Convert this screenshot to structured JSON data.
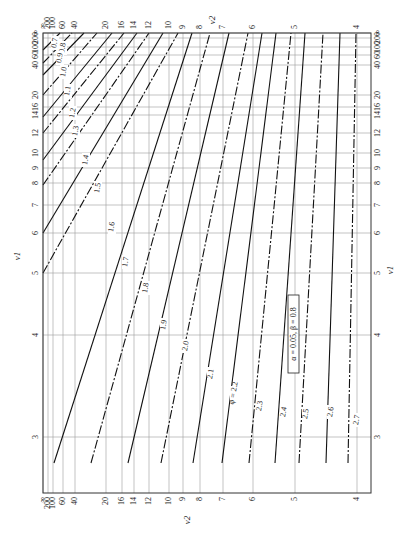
{
  "chart_data": {
    "type": "line",
    "annotation": "α = 0.05, β = 0.8",
    "rotation_note": "Figure printed rotated 90°; ν1 runs along the vertical edges, ν2 along the horizontal edges",
    "xlabel": "ν2",
    "ylabel": "ν1",
    "x_axis": {
      "name": "ν2",
      "scale": "reciprocal",
      "ticks": [
        "∞",
        "200",
        "100",
        "60",
        "40",
        "20",
        "16",
        "14",
        "12",
        "10",
        "9",
        "8",
        "7",
        "6",
        "5",
        "4"
      ],
      "tick_px": [
        43,
        48,
        53,
        63,
        75,
        106,
        122,
        134,
        149,
        169,
        183,
        200,
        223,
        253,
        295,
        357
      ]
    },
    "y_axis": {
      "name": "ν1",
      "scale": "reciprocal",
      "ticks": [
        "∞",
        "200",
        "100",
        "60",
        "40",
        "20",
        "16",
        "14",
        "12",
        "10",
        "9",
        "8",
        "7",
        "6",
        "5",
        "4",
        "3"
      ],
      "tick_px": [
        33,
        38,
        47,
        55,
        65,
        95,
        107,
        115,
        133,
        153,
        168,
        183,
        205,
        233,
        273,
        335,
        437
      ]
    },
    "frame": {
      "x0": 43,
      "y0": 33,
      "x1": 371,
      "y1": 493
    },
    "grid": true,
    "legend_position": "inline labels on curves",
    "series": [
      {
        "name": "0.7",
        "style": "solid",
        "points": [
          [
            43,
            50
          ],
          [
            60,
            33
          ]
        ],
        "label_pos": [
          55,
          43
        ]
      },
      {
        "name": "0.8",
        "style": "dashed",
        "points": [
          [
            43,
            63
          ],
          [
            72,
            33
          ]
        ],
        "label_pos": [
          63,
          48
        ]
      },
      {
        "name": "0.9",
        "style": "solid",
        "points": [
          [
            43,
            75
          ],
          [
            84,
            33
          ]
        ],
        "label_pos": [
          60,
          58
        ]
      },
      {
        "name": "1.0",
        "style": "dashed",
        "points": [
          [
            43,
            95
          ],
          [
            97,
            33
          ]
        ],
        "label_pos": [
          64,
          72
        ]
      },
      {
        "name": "1.1",
        "style": "solid",
        "points": [
          [
            43,
            117
          ],
          [
            112,
            33
          ]
        ],
        "label_pos": [
          68,
          91
        ]
      },
      {
        "name": "1.2",
        "style": "dashed",
        "points": [
          [
            43,
            133
          ],
          [
            124,
            33
          ]
        ],
        "label_pos": [
          73,
          113
        ]
      },
      {
        "name": "1.3",
        "style": "solid",
        "points": [
          [
            43,
            160
          ],
          [
            137,
            33
          ]
        ],
        "label_pos": [
          76,
          131
        ]
      },
      {
        "name": "1.4",
        "style": "dashed",
        "points": [
          [
            43,
            185
          ],
          [
            149,
            33
          ]
        ],
        "label_pos": [
          86,
          160
        ]
      },
      {
        "name": "1.5",
        "style": "solid",
        "points": [
          [
            43,
            233
          ],
          [
            163,
            33
          ]
        ],
        "label_pos": [
          98,
          188
        ]
      },
      {
        "name": "1.6",
        "style": "dashed",
        "points": [
          [
            43,
            273
          ],
          [
            178,
            33
          ]
        ],
        "label_pos": [
          112,
          227
        ]
      },
      {
        "name": "1.7",
        "style": "solid",
        "points": [
          [
            54,
            463
          ],
          [
            192,
            33
          ]
        ],
        "label_pos": [
          126,
          262
        ]
      },
      {
        "name": "1.8",
        "style": "dashed",
        "points": [
          [
            91,
            463
          ],
          [
            210,
            33
          ]
        ],
        "label_pos": [
          146,
          288
        ]
      },
      {
        "name": "1.9",
        "style": "solid",
        "points": [
          [
            128,
            463
          ],
          [
            229,
            33
          ]
        ],
        "label_pos": [
          164,
          325
        ]
      },
      {
        "name": "2.0",
        "style": "dashed",
        "points": [
          [
            161,
            463
          ],
          [
            248,
            33
          ]
        ],
        "label_pos": [
          186,
          346
        ]
      },
      {
        "name": "2.1",
        "style": "solid",
        "points": [
          [
            193,
            463
          ],
          [
            262,
            33
          ]
        ],
        "label_pos": [
          211,
          374
        ]
      },
      {
        "name": "2.2",
        "style": "solid",
        "points": [
          [
            222,
            463
          ],
          [
            276,
            33
          ]
        ],
        "label_pos": [
          234,
          393
        ],
        "label_prefix": "φ = "
      },
      {
        "name": "2.3",
        "style": "dashed",
        "points": [
          [
            249,
            463
          ],
          [
            291,
            33
          ]
        ],
        "label_pos": [
          260,
          406
        ]
      },
      {
        "name": "2.4",
        "style": "solid",
        "points": [
          [
            275,
            463
          ],
          [
            305,
            33
          ]
        ],
        "label_pos": [
          284,
          412
        ]
      },
      {
        "name": "2.5",
        "style": "dashed",
        "points": [
          [
            299,
            463
          ],
          [
            323,
            33
          ]
        ],
        "label_pos": [
          306,
          414
        ]
      },
      {
        "name": "2.6",
        "style": "solid",
        "points": [
          [
            326,
            463
          ],
          [
            340,
            33
          ]
        ],
        "label_pos": [
          331,
          412
        ]
      },
      {
        "name": "2.7",
        "style": "dashed",
        "points": [
          [
            348,
            463
          ],
          [
            356,
            33
          ]
        ],
        "label_pos": [
          357,
          420
        ]
      }
    ]
  },
  "axis_titles": {
    "top_nu2": "ν2",
    "bottom_nu2": "ν2",
    "left_nu1": "ν1",
    "right_nu1": "ν1"
  },
  "annotation_box": "α = 0.05, β = 0.8",
  "phi_prefix": "φ = "
}
